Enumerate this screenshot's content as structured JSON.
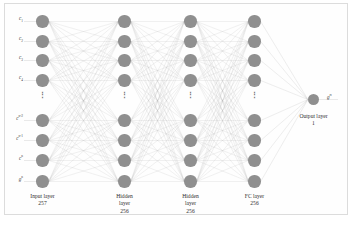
{
  "figure": {
    "type": "neural-network-architecture-diagram",
    "background": "#ffffff",
    "node_color": "#8f8f8f",
    "edge_color": "#a8a8a8",
    "frame_color": "#dcdcdc",
    "ellipsis_glyph": "⋮"
  },
  "layers": [
    {
      "id": "input",
      "caption_lines": [
        "Input layer",
        "257"
      ],
      "name": "Input layer",
      "size": "257",
      "visible_nodes": 8,
      "has_ellipsis": true
    },
    {
      "id": "hidden1",
      "caption_lines": [
        "Hidden",
        "layer",
        "256"
      ],
      "name": "Hidden layer",
      "size": "256",
      "visible_nodes": 8,
      "has_ellipsis": true
    },
    {
      "id": "hidden2",
      "caption_lines": [
        "Hidden",
        "layer",
        "256"
      ],
      "name": "Hidden layer",
      "size": "256",
      "visible_nodes": 8,
      "has_ellipsis": true
    },
    {
      "id": "fc",
      "caption_lines": [
        "FC layer",
        "256"
      ],
      "name": "FC layer",
      "size": "256",
      "visible_nodes": 8,
      "has_ellipsis": true
    },
    {
      "id": "output",
      "caption_lines": [
        "Output layer",
        "1"
      ],
      "name": "Output layer",
      "size": "1",
      "visible_nodes": 1,
      "has_ellipsis": false
    }
  ],
  "input_labels": [
    {
      "base": "c",
      "sub": "1",
      "sup": ""
    },
    {
      "base": "c",
      "sub": "2",
      "sup": ""
    },
    {
      "base": "c",
      "sub": "3",
      "sup": ""
    },
    {
      "base": "c",
      "sub": "4",
      "sup": ""
    },
    {
      "base": "c",
      "sub": "",
      "sup": "n-2"
    },
    {
      "base": "c",
      "sub": "",
      "sup": "n-1"
    },
    {
      "base": "c",
      "sub": "",
      "sup": "n"
    },
    {
      "base": "g",
      "sub": "",
      "sup": "n"
    }
  ],
  "output_label": {
    "base": "g",
    "sub": "",
    "sup": "n"
  }
}
